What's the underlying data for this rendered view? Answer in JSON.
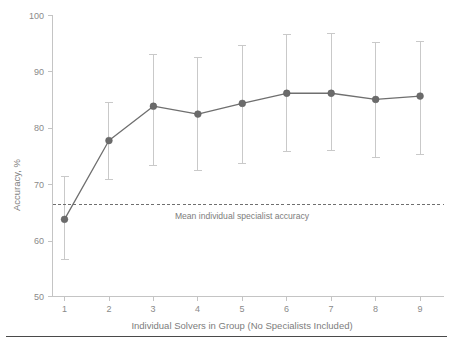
{
  "chart_data": {
    "type": "line",
    "title": "",
    "subtitle": "",
    "xlabel": "Individual Solvers in Group (No Specialists Included)",
    "ylabel": "Accuracy, %",
    "x": [
      1,
      2,
      3,
      4,
      5,
      6,
      7,
      8,
      9
    ],
    "xtick_labels": [
      "1",
      "2",
      "3",
      "4",
      "5",
      "6",
      "7",
      "8",
      "9"
    ],
    "ytick_labels": [
      "50",
      "60",
      "70",
      "80",
      "90",
      "100"
    ],
    "yticks": [
      50,
      60,
      70,
      80,
      90,
      100
    ],
    "xlim": [
      0.6,
      9.4
    ],
    "ylim": [
      50,
      100
    ],
    "grid": false,
    "legend": null,
    "series": [
      {
        "name": "Group accuracy",
        "values": [
          63.7,
          77.7,
          83.8,
          82.4,
          84.3,
          86.1,
          86.1,
          85.0,
          85.6
        ],
        "error_low": [
          56.5,
          70.8,
          73.2,
          72.3,
          73.6,
          75.8,
          75.9,
          74.7,
          75.2
        ],
        "error_high": [
          71.3,
          84.4,
          93.0,
          92.4,
          94.6,
          96.5,
          96.7,
          95.1,
          95.3
        ],
        "marker": "circle",
        "color": "#6b6b6b",
        "error_color": "#c9c9c9"
      }
    ],
    "reference_line": {
      "value": 66.3,
      "label": "Mean individual specialist accuracy",
      "style": "dashed",
      "color": "#6f6f6f"
    }
  },
  "axes": {
    "y_title": "Accuracy, %",
    "x_title": "Individual Solvers in Group (No Specialists Included)"
  },
  "annotations": {
    "reference": "Mean individual specialist accuracy"
  },
  "colors": {
    "marker": "#6b6b6b",
    "line": "#6f6f6f",
    "error": "#c9c9c9",
    "axis": "#c4c4c4",
    "text": "#7d7d7d",
    "footer_rule": "#4a4a4a"
  }
}
